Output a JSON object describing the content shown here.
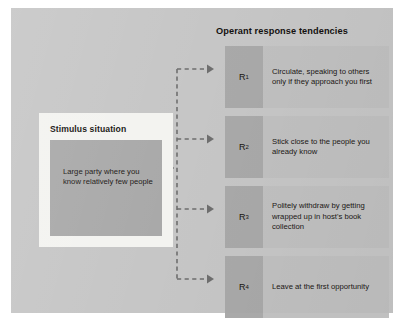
{
  "diagram": {
    "stimulus": {
      "title": "Stimulus situation",
      "text": "Large party where you know relatively few people"
    },
    "operant": {
      "title": "Operant response tendencies",
      "responses": [
        {
          "label": "R",
          "subscript": "1",
          "text": "Circulate, speaking to others only if they approach you first"
        },
        {
          "label": "R",
          "subscript": "2",
          "text": "Stick close to the people you already know"
        },
        {
          "label": "R",
          "subscript": "3",
          "text": "Politely withdraw by getting wrapped up in host's book collection"
        },
        {
          "label": "R",
          "subscript": "4",
          "text": "Leave at the first opportunity"
        }
      ]
    },
    "colors": {
      "panel_background": "#c6c6c6",
      "card_background": "#f3f3f0",
      "inner_box": "#a9a9a9",
      "response_row": "#c0c0c0",
      "response_label_box": "#a9a9a9",
      "connector": "#6e6e6e",
      "text": "#1b1714"
    }
  }
}
